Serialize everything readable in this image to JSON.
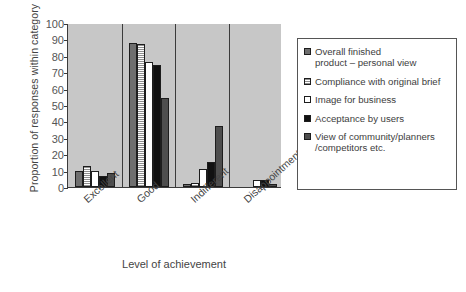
{
  "chart_data": {
    "type": "bar",
    "title": "",
    "xlabel": "Level of achievement",
    "ylabel": "Proportion of responses within category",
    "categories": [
      "Excellent",
      "Good",
      "Indifferent",
      "Disappointment"
    ],
    "ylim": [
      0,
      100
    ],
    "yticks": [
      0,
      10,
      20,
      30,
      40,
      50,
      60,
      70,
      80,
      90,
      100
    ],
    "grid": false,
    "legend_position": "right",
    "series": [
      {
        "name": "Overall finished product – personal view",
        "swatch": "#6e6e6e",
        "values": [
          10,
          88,
          2,
          0
        ]
      },
      {
        "name": "Compliance with original brief",
        "swatch": "#a8a8a8",
        "values": [
          13,
          87,
          2.5,
          0
        ]
      },
      {
        "name": "Image for business",
        "swatch": "#ffffff",
        "values": [
          10,
          76.5,
          11,
          4
        ]
      },
      {
        "name": "Acceptance by users",
        "swatch": "#111111",
        "values": [
          7,
          74.5,
          15,
          4
        ]
      },
      {
        "name": "View of community/planners /competitors etc.",
        "swatch": "#4e4e4e",
        "values": [
          8.5,
          54,
          37,
          2
        ]
      }
    ]
  },
  "legend": {
    "items": [
      {
        "label_line1": "Overall finished",
        "label_line2": "product – personal view"
      },
      {
        "label_line1": "Compliance with original brief",
        "label_line2": ""
      },
      {
        "label_line1": "Image for business",
        "label_line2": ""
      },
      {
        "label_line1": "Acceptance by users",
        "label_line2": ""
      },
      {
        "label_line1": "View of community/planners",
        "label_line2": "/competitors etc."
      }
    ]
  }
}
